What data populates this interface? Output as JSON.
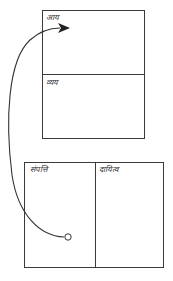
{
  "top_box": {
    "sections": [
      {
        "label": "आय"
      },
      {
        "label": "व्यय"
      }
    ]
  },
  "bottom_box": {
    "sections": [
      {
        "label": "संपत्ति"
      },
      {
        "label": "दायित्व"
      }
    ]
  },
  "arrow": {
    "from": "संपत्ति",
    "to": "आय",
    "color": "#333333"
  }
}
